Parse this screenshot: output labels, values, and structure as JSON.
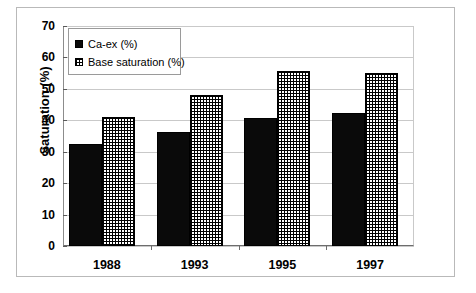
{
  "chart_data": {
    "type": "bar",
    "title": "",
    "xlabel": "",
    "ylabel": "Saturation (%)",
    "categories": [
      "1988",
      "1993",
      "1995",
      "1997"
    ],
    "series": [
      {
        "name": "Ca-ex (%)",
        "values": [
          32.5,
          36.3,
          40.7,
          42.2
        ],
        "pattern": "solid"
      },
      {
        "name": "Base saturation (%)",
        "values": [
          41.2,
          48.2,
          55.6,
          55.0
        ],
        "pattern": "crosshatch"
      }
    ],
    "ylim": [
      0,
      70
    ],
    "ytick_labels": [
      "70",
      "60",
      "50",
      "40",
      "30",
      "20",
      "10",
      "0"
    ],
    "ytick_values": [
      70,
      60,
      50,
      40,
      30,
      20,
      10,
      0
    ],
    "grid": true,
    "legend_position": "top-left"
  },
  "legend": {
    "items": [
      {
        "label": "Ca-ex (%)",
        "swatch": "solid-black-square"
      },
      {
        "label": "Base saturation (%)",
        "swatch": "crosshatch-square"
      }
    ]
  }
}
